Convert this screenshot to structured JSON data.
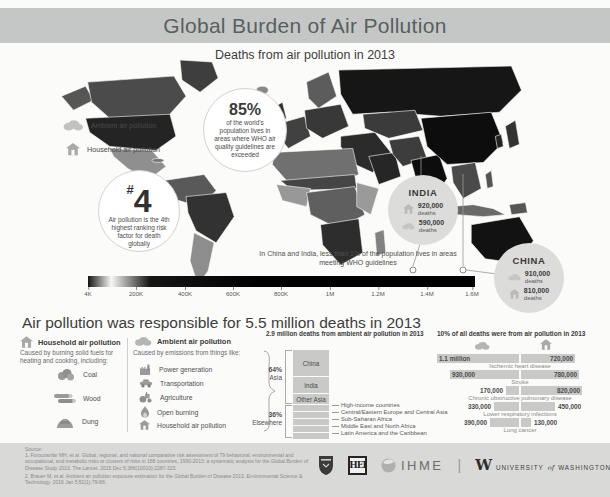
{
  "header": {
    "title": "Global Burden of Air Pollution"
  },
  "map": {
    "subtitle": "Deaths from air pollution in 2013",
    "legend": {
      "ambient": "Ambient air pollution",
      "household": "Household air pollution"
    },
    "rank_callout": {
      "prefix": "#",
      "rank": "4",
      "text": "Air pollution is the 4th highest ranking risk factor for death globally"
    },
    "population_callout": {
      "value": "85%",
      "text": "of the world's population lives in areas where WHO air quality guidelines are exceeded"
    },
    "india_callout": {
      "name": "INDIA",
      "household_value": "920,000",
      "ambient_value": "590,000",
      "deaths_word": "deaths"
    },
    "china_callout": {
      "name": "CHINA",
      "ambient_value": "910,000",
      "household_value": "810,000",
      "deaths_word": "deaths"
    },
    "who_note": "In China and India, less than 1% of the population lives in areas meeting WHO guidelines",
    "scale_ticks": [
      "4K",
      "200K",
      "400K",
      "600K",
      "800K",
      "1M",
      "1.2M",
      "1.4M",
      "1.6M"
    ]
  },
  "deaths_heading": "Air pollution was responsible for 5.5 million deaths in 2013",
  "household_column": {
    "title": "Household air pollution",
    "description": "Caused by burning solid fuels for heating and cooking, including:",
    "items": [
      {
        "icon": "coal-icon",
        "label": "Coal"
      },
      {
        "icon": "wood-icon",
        "label": "Wood"
      },
      {
        "icon": "dung-icon",
        "label": "Dung"
      }
    ]
  },
  "ambient_column": {
    "title": "Ambient air pollution",
    "description": "Caused by emissions from things like:",
    "items": [
      {
        "icon": "power-generation-icon",
        "label": "Power generation"
      },
      {
        "icon": "transportation-icon",
        "label": "Transportation"
      },
      {
        "icon": "agriculture-icon",
        "label": "Agriculture"
      },
      {
        "icon": "open-burning-icon",
        "label": "Open burning"
      },
      {
        "icon": "household-icon",
        "label": "Household air pollution"
      }
    ]
  },
  "chart_data": [
    {
      "type": "bar",
      "stacked": true,
      "title": "2.9 million deaths from ambient air pollution in 2013",
      "categories": [
        "China",
        "India",
        "Other Asia",
        "High-income countries",
        "Central/Eastern Europe and Central Asia",
        "Sub-Saharan Africa",
        "Middle East and North Africa",
        "Latin America and the Caribbean"
      ],
      "values_pct": [
        32,
        20,
        12,
        8,
        7,
        7,
        7,
        7
      ],
      "groups": [
        {
          "label": "64%",
          "sublabel": "Asia",
          "span": [
            "China",
            "India",
            "Other Asia"
          ]
        },
        {
          "label": "36%",
          "sublabel": "Elsewhere",
          "span": [
            "High-income countries",
            "Central/Eastern Europe and Central Asia",
            "Sub-Saharan Africa",
            "Middle East and North Africa",
            "Latin America and the Caribbean"
          ]
        }
      ]
    },
    {
      "type": "bar",
      "orientation": "horizontal-paired",
      "title": "10% of all deaths were from air pollution in 2013",
      "categories": [
        "Ischemic heart disease",
        "Stroke",
        "Chronic obstructive pulmonary disease",
        "Lower respiratory infections",
        "Lung cancer"
      ],
      "series": [
        {
          "name": "Ambient air pollution",
          "values": [
            1100000,
            930000,
            170000,
            330000,
            390000
          ]
        },
        {
          "name": "Household air pollution",
          "values": [
            720000,
            780000,
            820000,
            450000,
            130000
          ]
        }
      ],
      "value_labels": [
        [
          "1.1 million",
          "720,000"
        ],
        [
          "930,000",
          "780,000"
        ],
        [
          "170,000",
          "820,000"
        ],
        [
          "330,000",
          "450,000"
        ],
        [
          "390,000",
          "130,000"
        ]
      ],
      "max_value": 1100000
    }
  ],
  "source": {
    "label": "Source:",
    "line1": "1. Forouzanfar MH, et al. Global, regional, and national comparative risk assessment of 79 behavioral, environmental and occupational, and metabolic risks or clusters of risks in 188 countries, 1990-2013: a systematic analysis for the Global Burden of Disease Study 2013. The Lancet. 2015 Dec 5;386(10010):2287-323.",
    "line2": "2. Brauer M, et al. Ambient air pollution exposure estimation for the Global Burden of Disease 2013. Environmental Science & Technology. 2016 Jan 5;50(1):79-88."
  },
  "footer": {
    "hei_label": "HEI",
    "ihme_label": "IHME",
    "divider": "|",
    "uw_w": "W",
    "uw_university": "UNIVERSITY",
    "uw_of": "of",
    "uw_washington": "WASHINGTON"
  },
  "colors": {
    "header_bg": "#c5c7c6",
    "bar_fill": "#c9c9c7",
    "footer_bg": "#d9d9d7",
    "map_dark": "#0d0d0d"
  }
}
